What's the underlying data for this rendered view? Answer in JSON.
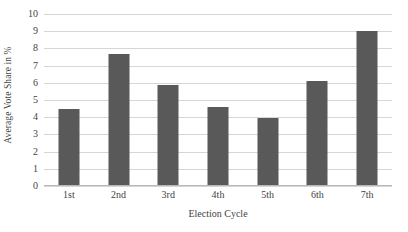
{
  "chart_data": {
    "type": "bar",
    "title": "",
    "subtitle": "",
    "xlabel": "Election Cycle",
    "ylabel": "Average Vote Share in %",
    "categories": [
      "1st",
      "2nd",
      "3rd",
      "4th",
      "5th",
      "6th",
      "7th"
    ],
    "values": [
      4.5,
      7.7,
      5.85,
      4.6,
      3.95,
      6.1,
      9.0
    ],
    "ylim": [
      0,
      10
    ],
    "yticks": [
      0,
      1,
      2,
      3,
      4,
      5,
      6,
      7,
      8,
      9,
      10
    ],
    "ytick_labels": [
      "0",
      "1",
      "2",
      "3",
      "4",
      "5",
      "6",
      "7",
      "8",
      "9",
      "10"
    ],
    "grid": true,
    "grid_axis": "y",
    "legend": false,
    "legend_position": "none",
    "bar_color": "#595959",
    "gridline_color": "#d6d6d6",
    "axis_color": "#b8b8b8",
    "background_color": "#ffffff",
    "annotations": []
  }
}
